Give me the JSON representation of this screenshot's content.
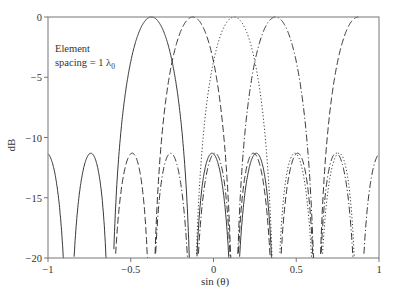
{
  "chart_data": {
    "type": "line",
    "title": "",
    "xlabel": "sin (θ)",
    "ylabel": "dB",
    "xlim": [
      -1,
      1
    ],
    "ylim": [
      -20,
      0
    ],
    "xticks": [
      -1,
      -0.5,
      0,
      0.5,
      1
    ],
    "xtick_labels": [
      "−1",
      "−0.5",
      "0",
      "0.5",
      "1"
    ],
    "yticks": [
      0,
      -5,
      -10,
      -15,
      -20
    ],
    "ytick_labels": [
      "0",
      "−5",
      "−10",
      "−15",
      "−20"
    ],
    "grid": false,
    "annotation": {
      "line1": "Element",
      "line2": "spacing = 1 λ",
      "subscript": "0"
    },
    "array": {
      "elements": 4,
      "spacing_wavelengths": 1
    },
    "series": [
      {
        "name": "beam-1",
        "style": "solid",
        "peak_sin_theta": -0.375,
        "peak_db": 0,
        "sidelobe_db": -11.3,
        "window": [
          -1.0,
          0.375
        ]
      },
      {
        "name": "beam-2",
        "style": "dashed",
        "peak_sin_theta": -0.125,
        "peak_db": 0,
        "sidelobe_db": -11.3,
        "window": [
          -0.625,
          0.875
        ]
      },
      {
        "name": "beam-3",
        "style": "dotted",
        "peak_sin_theta": 0.125,
        "peak_db": 0,
        "sidelobe_db": -11.3,
        "window": [
          -0.125,
          0.875
        ]
      },
      {
        "name": "beam-4",
        "style": "dashdot",
        "peak_sin_theta": 0.375,
        "peak_db": 0,
        "sidelobe_db": -11.3,
        "window": [
          -0.375,
          1.0
        ]
      }
    ]
  }
}
